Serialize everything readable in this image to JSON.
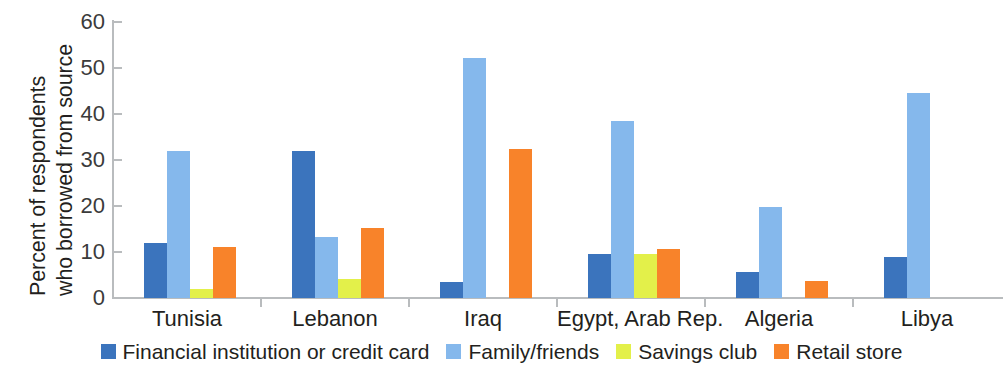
{
  "chart_data": {
    "type": "bar",
    "title": "",
    "subtitle": "",
    "xlabel": "",
    "ylabel": "Percent of respondents who borrowed from source",
    "ylabel_lines": [
      "Percent of respondents",
      "who borrowed from source"
    ],
    "ylim": [
      0,
      60
    ],
    "yticks": [
      0,
      10,
      20,
      30,
      40,
      50,
      60
    ],
    "ytick_labels": [
      "0",
      "10",
      "20",
      "30",
      "40",
      "50",
      "60"
    ],
    "grid": false,
    "legend_position": "bottom",
    "grouped": true,
    "categories": [
      "Tunisia",
      "Lebanon",
      "Iraq",
      "Egypt, Arab Rep.",
      "Algeria",
      "Libya"
    ],
    "series": [
      {
        "name": "Financial institution or credit card",
        "color": "#3b74bd",
        "values": [
          12.0,
          32.0,
          3.4,
          9.6,
          5.7,
          9.0
        ]
      },
      {
        "name": "Family/friends",
        "color": "#85b8ec",
        "values": [
          32.0,
          13.3,
          52.2,
          38.5,
          19.8,
          44.5
        ]
      },
      {
        "name": "Savings club",
        "color": "#e3f04a",
        "values": [
          2.0,
          4.2,
          0.0,
          9.6,
          0.0,
          0.0
        ]
      },
      {
        "name": "Retail store",
        "color": "#f8832a",
        "values": [
          11.0,
          15.2,
          32.3,
          10.7,
          3.8,
          0.0
        ]
      }
    ]
  },
  "legend": {
    "items": [
      {
        "label": "Financial institution or credit card",
        "color": "#3b74bd"
      },
      {
        "label": "Family/friends",
        "color": "#85b8ec"
      },
      {
        "label": "Savings club",
        "color": "#e3f04a"
      },
      {
        "label": "Retail store",
        "color": "#f8832a"
      }
    ]
  },
  "axis": {
    "line_color": "#b9bcbe",
    "text_color": "#231f20",
    "tick_text_color": "#3b3b3b"
  }
}
